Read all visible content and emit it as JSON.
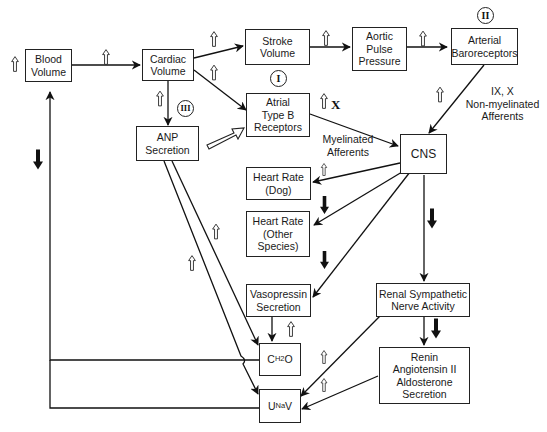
{
  "diagram": {
    "nodes": {
      "blood_volume": "Blood\nVolume",
      "cardiac_volume": "Cardiac\nVolume",
      "stroke_volume": "Stroke\nVolume",
      "aortic_pulse_pressure": "Aortic\nPulse\nPressure",
      "arterial_baroreceptors": "Arterial\nBaroreceptors",
      "atrial_type_b_receptors": "Atrial\nType B\nReceptors",
      "anp_secretion": "ANP\nSecretion",
      "cns": "CNS",
      "heart_rate_dog": "Heart Rate\n(Dog)",
      "heart_rate_other": "Heart Rate\n(Other\nSpecies)",
      "vasopressin_secretion": "Vasopressin\nSecretion",
      "renal_sympathetic": "Renal Sympathetic\nNerve Activity",
      "renin_angiotensin": "Renin\nAngiotensin II\nAldosterone\nSecretion",
      "ch2o": {
        "main": "C",
        "sub": "H2",
        "tail": " O"
      },
      "unav": {
        "main": "U",
        "sub": "Na",
        "tail": "V"
      }
    },
    "labels": {
      "non_myelinated": "IX, X\nNon-myelinated\nAfferents",
      "myelinated": "Myelinated\nAfferents",
      "x_nerve": "X"
    },
    "roman_markers": {
      "marker_1": "I",
      "marker_2": "II",
      "marker_3": "III"
    },
    "edges": [
      {
        "from": "Blood Volume",
        "to": "Cardiac Volume",
        "effect": "increase"
      },
      {
        "from": "Cardiac Volume",
        "to": "Stroke Volume",
        "effect": "increase"
      },
      {
        "from": "Cardiac Volume",
        "to": "Atrial Type B Receptors",
        "effect": "increase"
      },
      {
        "from": "Cardiac Volume",
        "to": "ANP Secretion",
        "effect": "increase"
      },
      {
        "from": "Stroke Volume",
        "to": "Aortic Pulse Pressure",
        "effect": "increase"
      },
      {
        "from": "Aortic Pulse Pressure",
        "to": "Arterial Baroreceptors",
        "effect": "increase"
      },
      {
        "from": "Arterial Baroreceptors",
        "to": "CNS",
        "effect": "increase",
        "via": "IX, X Non-myelinated Afferents"
      },
      {
        "from": "Atrial Type B Receptors",
        "to": "CNS",
        "effect": "increase",
        "via": "Myelinated Afferents (X)"
      },
      {
        "from": "ANP Secretion",
        "to": "Atrial Type B Receptors",
        "effect": "sensitize"
      },
      {
        "from": "CNS",
        "to": "Heart Rate (Dog)",
        "effect": "increase"
      },
      {
        "from": "CNS",
        "to": "Heart Rate (Other Species)",
        "effect": "decrease"
      },
      {
        "from": "CNS",
        "to": "Vasopressin Secretion",
        "effect": "decrease"
      },
      {
        "from": "CNS",
        "to": "Renal Sympathetic Nerve Activity",
        "effect": "decrease"
      },
      {
        "from": "Renal Sympathetic Nerve Activity",
        "to": "Renin Angiotensin II Aldosterone Secretion",
        "effect": "decrease"
      },
      {
        "from": "Renal Sympathetic Nerve Activity",
        "to": "UNaV",
        "effect": "increase"
      },
      {
        "from": "Renin Angiotensin II Aldosterone Secretion",
        "to": "UNaV",
        "effect": "increase"
      },
      {
        "from": "Vasopressin Secretion",
        "to": "CH2O",
        "effect": "increase"
      },
      {
        "from": "ANP Secretion",
        "to": "CH2O",
        "effect": "increase"
      },
      {
        "from": "ANP Secretion",
        "to": "UNaV",
        "effect": "increase"
      },
      {
        "from": "CH2O",
        "to": "Blood Volume",
        "effect": "decrease"
      },
      {
        "from": "UNaV",
        "to": "Blood Volume",
        "effect": "decrease"
      }
    ]
  }
}
